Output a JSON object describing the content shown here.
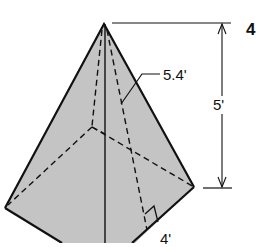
{
  "problem": {
    "number": "4"
  },
  "figure": {
    "type": "square pyramid",
    "fill_color": "#c4c4c4",
    "line_color": "#111111",
    "labels": {
      "slant_height": "5.4'",
      "height": "5'",
      "base_half": "4'"
    }
  }
}
